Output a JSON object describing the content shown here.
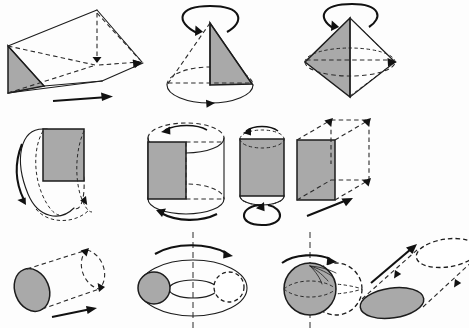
{
  "page": {
    "title": "Solids generated by translation and revolution",
    "background_color": "#fdfdfd",
    "width": 469,
    "height": 328
  },
  "style_colors": {
    "shaded_fill": "#a9a9a9",
    "outline": "#1c1c1c",
    "hidden_line": "#2a2a2a",
    "arrow": "#111111",
    "unshaded_fill": "#ffffff"
  },
  "figures": [
    {
      "id": "triangular-prism",
      "row": 1,
      "column": 1,
      "generator_shape": "triangle",
      "motion": "translation",
      "motion_direction": "horizontal-right",
      "resulting_solid": "triangular prism",
      "arrow_kind": "straight",
      "shaded": true
    },
    {
      "id": "cone",
      "row": 1,
      "column": 2,
      "generator_shape": "right triangle",
      "motion": "revolution",
      "motion_direction": "about vertical axis",
      "resulting_solid": "cone",
      "arrow_kind": "curved-loop",
      "shaded": true
    },
    {
      "id": "bicone",
      "row": 1,
      "column": 3,
      "generator_shape": "triangle",
      "motion": "revolution",
      "motion_direction": "about vertical axis",
      "resulting_solid": "bicone",
      "arrow_kind": "curved-loop",
      "shaded": true
    },
    {
      "id": "horizontal-axis-cylinder",
      "row": 2,
      "column": 1,
      "generator_shape": "rectangle",
      "motion": "revolution",
      "motion_direction": "about horizontal axis",
      "resulting_solid": "cylinder",
      "arrow_kind": "curved-loop",
      "shaded": true
    },
    {
      "id": "vertical-axis-cylinder",
      "row": 2,
      "column": 2,
      "generator_shape": "rectangle",
      "motion": "revolution",
      "motion_direction": "about vertical edge axis",
      "resulting_solid": "cylinder",
      "arrow_kind": "curved-loop",
      "shaded": true
    },
    {
      "id": "narrow-cylinder",
      "row": 2,
      "column": 3,
      "generator_shape": "rectangle",
      "motion": "revolution",
      "motion_direction": "about vertical center axis",
      "resulting_solid": "narrow cylinder",
      "arrow_kind": "curved-loop",
      "shaded": true
    },
    {
      "id": "rectangular-prism",
      "row": 2,
      "column": 4,
      "generator_shape": "rectangle",
      "motion": "translation",
      "motion_direction": "oblique back-right",
      "resulting_solid": "rectangular prism",
      "arrow_kind": "straight",
      "shaded": true
    },
    {
      "id": "oblique-cylinder-translation",
      "row": 3,
      "column": 1,
      "generator_shape": "circle",
      "motion": "translation",
      "motion_direction": "oblique up-right",
      "resulting_solid": "cylinder",
      "arrow_kind": "straight",
      "shaded": true
    },
    {
      "id": "torus",
      "row": 3,
      "column": 2,
      "generator_shape": "circle",
      "motion": "revolution",
      "motion_direction": "about vertical axis offset from circle",
      "resulting_solid": "torus",
      "arrow_kind": "curved",
      "shaded": true
    },
    {
      "id": "sphere",
      "row": 3,
      "column": 3,
      "generator_shape": "circle",
      "motion": "revolution",
      "motion_direction": "about tangent vertical axis",
      "resulting_solid": "sphere",
      "arrow_kind": "curved",
      "shaded": true
    },
    {
      "id": "slanted-cylinder",
      "row": 3,
      "column": 4,
      "generator_shape": "ellipse",
      "motion": "translation",
      "motion_direction": "oblique up-right",
      "resulting_solid": "oblique cylinder",
      "arrow_kind": "straight",
      "shaded": true
    }
  ]
}
